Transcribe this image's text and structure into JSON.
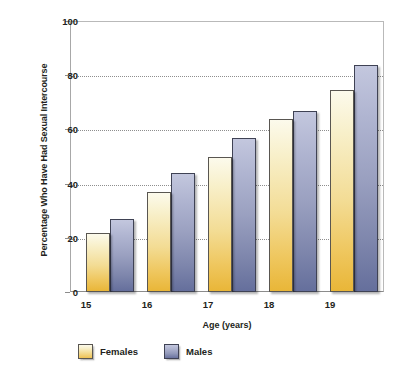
{
  "chart_data": {
    "type": "bar",
    "title": "",
    "xlabel": "Age (years)",
    "ylabel": "Percentage Who Have Had Sexual Intercourse",
    "categories": [
      "15",
      "16",
      "17",
      "18",
      "19"
    ],
    "series": [
      {
        "name": "Females",
        "color": "#f0d080",
        "values": [
          22,
          37,
          50,
          64,
          75
        ]
      },
      {
        "name": "Males",
        "color": "#7a82ae",
        "values": [
          27,
          44,
          57,
          67,
          84
        ]
      }
    ],
    "ylim": [
      0,
      100
    ],
    "yticks": [
      0,
      20,
      40,
      60,
      80,
      100
    ],
    "ytick_labels": [
      "0",
      "20",
      "40",
      "60",
      "80",
      "100"
    ],
    "gridlines": [
      20,
      40,
      60,
      80
    ],
    "grid": true,
    "legend_position": "bottom-left"
  },
  "legend": {
    "items": [
      {
        "label": "Females"
      },
      {
        "label": "Males"
      }
    ]
  }
}
